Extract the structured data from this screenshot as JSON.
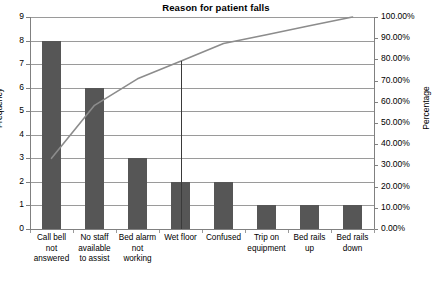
{
  "chart_data": {
    "type": "bar",
    "title": "Reason for patient falls",
    "xlabel": "",
    "ylabel": "Frequency",
    "y2label": "Percentage",
    "grid": true,
    "legend": "none",
    "ylim": [
      0,
      9
    ],
    "y2lim": [
      0,
      100
    ],
    "categories": [
      "Call bell not answered",
      "No staff available to assist",
      "Bed alarm not working",
      "Wet floor",
      "Confused",
      "Trip on equipment",
      "Bed rails up",
      "Bed rails down"
    ],
    "category_lines": [
      [
        "Call bell",
        "not",
        "answered"
      ],
      [
        "No staff",
        "available",
        "to assist"
      ],
      [
        "Bed alarm",
        "not",
        "working"
      ],
      [
        "Wet floor"
      ],
      [
        "Confused"
      ],
      [
        "Trip on",
        "equipment"
      ],
      [
        "Bed rails",
        "up"
      ],
      [
        "Bed rails",
        "down"
      ]
    ],
    "values": [
      8,
      6,
      3,
      2,
      2,
      1,
      1,
      1
    ],
    "total": 24,
    "series": [
      {
        "name": "Frequency",
        "type": "bar",
        "values": [
          8,
          6,
          3,
          2,
          2,
          1,
          1,
          1
        ]
      },
      {
        "name": "Cumulative Percentage",
        "type": "line",
        "values": [
          33.33,
          58.33,
          70.83,
          79.17,
          87.5,
          91.67,
          95.83,
          100.0
        ]
      }
    ],
    "y_ticks": [
      "0",
      "1",
      "2",
      "3",
      "4",
      "5",
      "6",
      "7",
      "8",
      "9"
    ],
    "y2_ticks": [
      "0.00%",
      "10.00%",
      "20.00%",
      "30.00%",
      "40.00%",
      "50.00%",
      "60.00%",
      "70.00%",
      "80.00%",
      "90.00%",
      "100.00%"
    ],
    "annotations": [
      {
        "name": "eighty-percent-reference-line",
        "at_category": "Wet floor",
        "value": 79.17
      }
    ],
    "colors": {
      "bar": "#565656",
      "line": "#8c8c8c",
      "grid": "#9a9a9a",
      "axis": "#808080",
      "marker": "#3a3a3a",
      "background": "#ffffff"
    }
  }
}
